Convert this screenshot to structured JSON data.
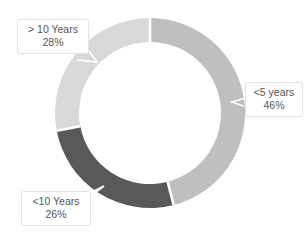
{
  "chart_data": {
    "type": "pie",
    "variant": "donut",
    "title": "",
    "subtitle": "",
    "xlabel": "",
    "ylabel": "",
    "legend": "none",
    "grid": false,
    "labels_position": "callout-boxes",
    "start_angle_deg": 0,
    "direction": "clockwise",
    "categories": [
      "<5 years",
      "<10 Years",
      "> 10 Years"
    ],
    "values": [
      46,
      26,
      28
    ],
    "value_unit": "%",
    "data_labels": [
      "46%",
      "26%",
      "28%"
    ],
    "colors": [
      "#bfbfbf",
      "#595959",
      "#d9d9d9"
    ],
    "slices": [
      {
        "name": "<5 years",
        "value": 46,
        "label": "46%",
        "color": "#bfbfbf",
        "start_deg": 0,
        "end_deg": 165.6
      },
      {
        "name": "<10 Years",
        "value": 26,
        "label": "26%",
        "color": "#595959",
        "start_deg": 165.6,
        "end_deg": 259.2
      },
      {
        "name": "> 10 Years",
        "value": 28,
        "label": "28%",
        "color": "#d9d9d9",
        "start_deg": 259.2,
        "end_deg": 360
      }
    ]
  },
  "callouts": {
    "over10": {
      "category": "> 10 Years",
      "percent": "28%"
    },
    "under5": {
      "category": "<5 years",
      "percent": "46%"
    },
    "under10": {
      "category": "<10 Years",
      "percent": "26%"
    }
  },
  "colors": {
    "slice_light": "#d9d9d9",
    "slice_mid": "#bfbfbf",
    "slice_dark": "#595959",
    "background": "#ffffff",
    "callout_border": "#e3e3e3",
    "callout_text": "#555555",
    "leader_line": "#ffffff"
  }
}
